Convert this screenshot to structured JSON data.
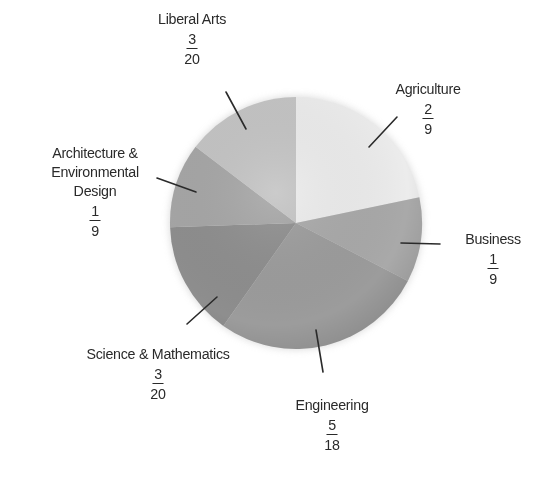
{
  "chart_data": {
    "type": "pie",
    "title": "",
    "start_angle_deg": 0,
    "direction": "clockwise",
    "slices": [
      {
        "label": "Agriculture",
        "fraction": "2/9",
        "numerator": "2",
        "denominator": "9",
        "value": 0.2222,
        "color": "#ececec"
      },
      {
        "label": "Business",
        "fraction": "1/9",
        "numerator": "1",
        "denominator": "9",
        "value": 0.1111,
        "color": "#a9a9a9"
      },
      {
        "label": "Engineering",
        "fraction": "5/18",
        "numerator": "5",
        "denominator": "18",
        "value": 0.2778,
        "color": "#9c9c9c"
      },
      {
        "label": "Science & Mathematics",
        "fraction": "3/20",
        "numerator": "3",
        "denominator": "20",
        "value": 0.15,
        "color": "#8e8e8e"
      },
      {
        "label": "Architecture & Environmental Design",
        "fraction": "1/9",
        "numerator": "1",
        "denominator": "9",
        "value": 0.1111,
        "color": "#a6a6a6"
      },
      {
        "label": "Liberal Arts",
        "fraction": "3/20",
        "numerator": "3",
        "denominator": "20",
        "value": 0.15,
        "color": "#c4c4c4"
      }
    ],
    "legend": "none (callout labels)"
  },
  "labels": {
    "liberal_arts": {
      "line1": "Liberal Arts",
      "num": "3",
      "den": "20"
    },
    "agriculture": {
      "line1": "Agriculture",
      "num": "2",
      "den": "9"
    },
    "architecture": {
      "line1": "Architecture &",
      "line2": "Environmental",
      "line3": "Design",
      "num": "1",
      "den": "9"
    },
    "business": {
      "line1": "Business",
      "num": "1",
      "den": "9"
    },
    "science": {
      "line1": "Science & Mathematics",
      "num": "3",
      "den": "20"
    },
    "engineering": {
      "line1": "Engineering",
      "num": "5",
      "den": "18"
    }
  }
}
